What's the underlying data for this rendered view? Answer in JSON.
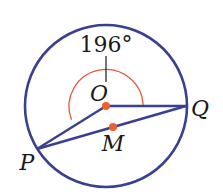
{
  "diagram": {
    "type": "circle-geometry",
    "colors": {
      "circle": "#3a3f8f",
      "segments": "#3a3f8f",
      "arc": "#e8553a",
      "points": "#f0602e",
      "text": "#1a1a1a"
    },
    "circle": {
      "center": "O",
      "cx": 106,
      "cy": 106,
      "r": 81
    },
    "points": {
      "O": {
        "label": "O",
        "x": 106,
        "y": 106
      },
      "Q": {
        "label": "Q",
        "x": 186,
        "y": 106
      },
      "P": {
        "label": "P",
        "x": 37,
        "y": 149
      },
      "M": {
        "label": "M",
        "x": 113,
        "y": 127
      }
    },
    "segments": [
      "OQ",
      "OP",
      "PQ"
    ],
    "angle": {
      "label": "196°",
      "vertex": "O",
      "measure": 196
    }
  }
}
